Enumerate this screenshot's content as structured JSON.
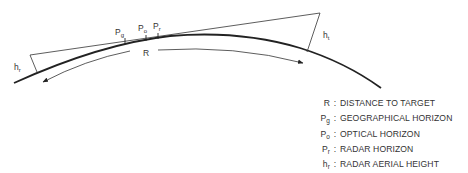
{
  "diagram": {
    "labels": {
      "R": "R",
      "hr": {
        "main": "h",
        "sub": "r"
      },
      "ht": {
        "main": "h",
        "sub": "t"
      },
      "Pg": {
        "main": "P",
        "sub": "g"
      },
      "Po": {
        "main": "P",
        "sub": "o"
      },
      "Pr": {
        "main": "P",
        "sub": "r"
      }
    },
    "colors": {
      "line": "#222222",
      "text": "#333333",
      "background": "#ffffff"
    }
  },
  "legend": {
    "items": [
      {
        "symbol": "R",
        "sub": "",
        "description": "DISTANCE TO TARGET"
      },
      {
        "symbol": "P",
        "sub": "g",
        "description": "GEOGRAPHICAL HORIZON"
      },
      {
        "symbol": "P",
        "sub": "o",
        "description": "OPTICAL HORIZON"
      },
      {
        "symbol": "P",
        "sub": "r",
        "description": "RADAR HORIZON"
      },
      {
        "symbol": "h",
        "sub": "r",
        "description": "RADAR AERIAL HEIGHT"
      },
      {
        "symbol": "h",
        "sub": "t",
        "description": "TARGET HEIGHT"
      }
    ],
    "separator": ":"
  }
}
